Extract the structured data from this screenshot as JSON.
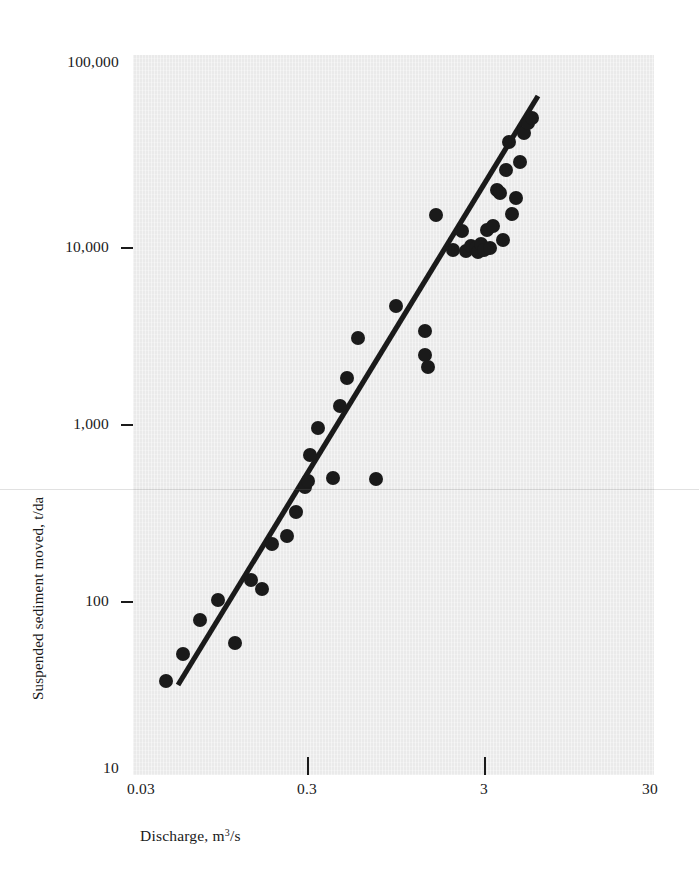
{
  "figure": {
    "background_color": "#ffffff",
    "panel_color": "#eaeaea",
    "ink_color": "#1a1a1a"
  },
  "axis_titles": {
    "x_prefix": "Discharge, m",
    "x_exponent": "3",
    "x_suffix": "/s",
    "y": "Suspended sediment moved, t/da"
  },
  "y_ticks": [
    {
      "label": "100,000",
      "value": 100000,
      "y_px": 62,
      "dash": false
    },
    {
      "label": "10,000",
      "value": 10000,
      "y_px": 247,
      "dash": true
    },
    {
      "label": "1,000",
      "value": 1000,
      "y_px": 424,
      "dash": true
    },
    {
      "label": "100",
      "value": 100,
      "y_px": 601,
      "dash": true
    },
    {
      "label": "10",
      "value": 10,
      "y_px": 768,
      "dash": false
    }
  ],
  "x_ticks": [
    {
      "label": "0.03",
      "value": 0.03,
      "x_px": 141,
      "mark": false
    },
    {
      "label": "0.3",
      "value": 0.3,
      "x_px": 307,
      "mark": true
    },
    {
      "label": "3",
      "value": 3,
      "x_px": 484,
      "mark": true
    },
    {
      "label": "30",
      "value": 30,
      "x_px": 650,
      "mark": false
    }
  ],
  "chart_data": {
    "type": "scatter",
    "title": "",
    "subtitle": "",
    "xlabel": "Discharge, m3/s",
    "ylabel": "Suspended sediment moved, t/da",
    "xscale": "log",
    "yscale": "log",
    "xlim": [
      0.03,
      30
    ],
    "ylim": [
      10,
      100000
    ],
    "grid": false,
    "legend": null,
    "marker": {
      "shape": "circle",
      "color": "#1a1a1a",
      "radius_px": 7
    },
    "annotations": [],
    "series": [
      {
        "name": "Observations",
        "kind": "scatter",
        "points_px": [
          [
            166,
            681
          ],
          [
            183,
            654
          ],
          [
            200,
            620
          ],
          [
            218,
            600
          ],
          [
            235,
            643
          ],
          [
            251,
            580
          ],
          [
            262,
            589
          ],
          [
            272,
            544
          ],
          [
            287,
            536
          ],
          [
            296,
            512
          ],
          [
            305,
            487
          ],
          [
            308,
            481
          ],
          [
            310,
            455
          ],
          [
            318,
            428
          ],
          [
            333,
            478
          ],
          [
            340,
            406
          ],
          [
            347,
            378
          ],
          [
            358,
            338
          ],
          [
            376,
            479
          ],
          [
            396,
            306
          ],
          [
            425,
            331
          ],
          [
            425,
            355
          ],
          [
            428,
            367
          ],
          [
            436,
            215
          ],
          [
            453,
            250
          ],
          [
            462,
            231
          ],
          [
            466,
            251
          ],
          [
            471,
            246
          ],
          [
            476,
            248
          ],
          [
            478,
            252
          ],
          [
            481,
            244
          ],
          [
            484,
            250
          ],
          [
            487,
            230
          ],
          [
            490,
            248
          ],
          [
            493,
            226
          ],
          [
            497,
            190
          ],
          [
            500,
            193
          ],
          [
            503,
            240
          ],
          [
            506,
            170
          ],
          [
            509,
            142
          ],
          [
            512,
            214
          ],
          [
            516,
            198
          ],
          [
            520,
            162
          ],
          [
            524,
            133
          ],
          [
            528,
            123
          ],
          [
            532,
            118
          ]
        ],
        "points_data": [
          [
            0.048,
            52
          ],
          [
            0.06,
            82
          ],
          [
            0.074,
            105
          ],
          [
            0.087,
            128
          ],
          [
            0.105,
            62
          ],
          [
            0.124,
            160
          ],
          [
            0.136,
            148
          ],
          [
            0.15,
            215
          ],
          [
            0.175,
            235
          ],
          [
            0.196,
            300
          ],
          [
            0.215,
            390
          ],
          [
            0.222,
            420
          ],
          [
            0.23,
            510
          ],
          [
            0.255,
            690
          ],
          [
            0.3,
            430
          ],
          [
            0.32,
            870
          ],
          [
            0.35,
            1180
          ],
          [
            0.4,
            2050
          ],
          [
            0.51,
            420
          ],
          [
            0.64,
            3200
          ],
          [
            0.9,
            2350
          ],
          [
            0.9,
            1550
          ],
          [
            0.94,
            1320
          ],
          [
            1.15,
            11500
          ],
          [
            1.5,
            6700
          ],
          [
            1.75,
            9200
          ],
          [
            1.86,
            6600
          ],
          [
            2.0,
            7100
          ],
          [
            2.15,
            6900
          ],
          [
            2.22,
            6600
          ],
          [
            2.33,
            7300
          ],
          [
            2.45,
            6900
          ],
          [
            2.58,
            9600
          ],
          [
            2.7,
            7100
          ],
          [
            2.84,
            10200
          ],
          [
            3.05,
            18500
          ],
          [
            3.2,
            17800
          ],
          [
            3.35,
            7700
          ],
          [
            3.55,
            24500
          ],
          [
            3.75,
            36000
          ],
          [
            3.95,
            13500
          ],
          [
            4.25,
            20500
          ],
          [
            4.55,
            29500
          ],
          [
            4.9,
            43000
          ],
          [
            5.25,
            48500
          ],
          [
            5.6,
            52000
          ]
        ]
      },
      {
        "name": "Fitted regression line",
        "kind": "line",
        "line_px": [
          [
            45,
            630
          ],
          [
            405,
            41
          ]
        ],
        "line_data": [
          [
            0.052,
            38
          ],
          [
            5.9,
            57000
          ]
        ]
      }
    ]
  }
}
